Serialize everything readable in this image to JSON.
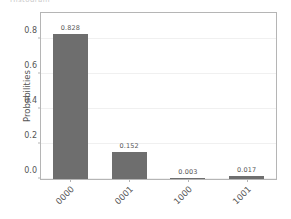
{
  "figure": {
    "suptitle_fragment": "Histogram",
    "background": "#ffffff"
  },
  "chart_data": {
    "type": "bar",
    "title": "",
    "xlabel": "",
    "ylabel": "Probabilities",
    "categories": [
      "0000",
      "0001",
      "1000",
      "1001"
    ],
    "values": [
      0.828,
      0.152,
      0.003,
      0.017
    ],
    "value_labels": [
      "0.828",
      "0.152",
      "0.003",
      "0.017"
    ],
    "ylim": [
      0.0,
      0.95
    ],
    "yticks": [
      0.0,
      0.2,
      0.4,
      0.6,
      0.8
    ],
    "ytick_labels": [
      "0.0",
      "0.2",
      "0.4",
      "0.6",
      "0.8"
    ],
    "grid": true,
    "grid_axis": "y",
    "legend": false,
    "bar_color": "#6e6e6e",
    "text_color": "#555555",
    "grid_color": "#f0f0f0",
    "axis_color": "#b5b5b5",
    "xtick_rotation": -45
  }
}
